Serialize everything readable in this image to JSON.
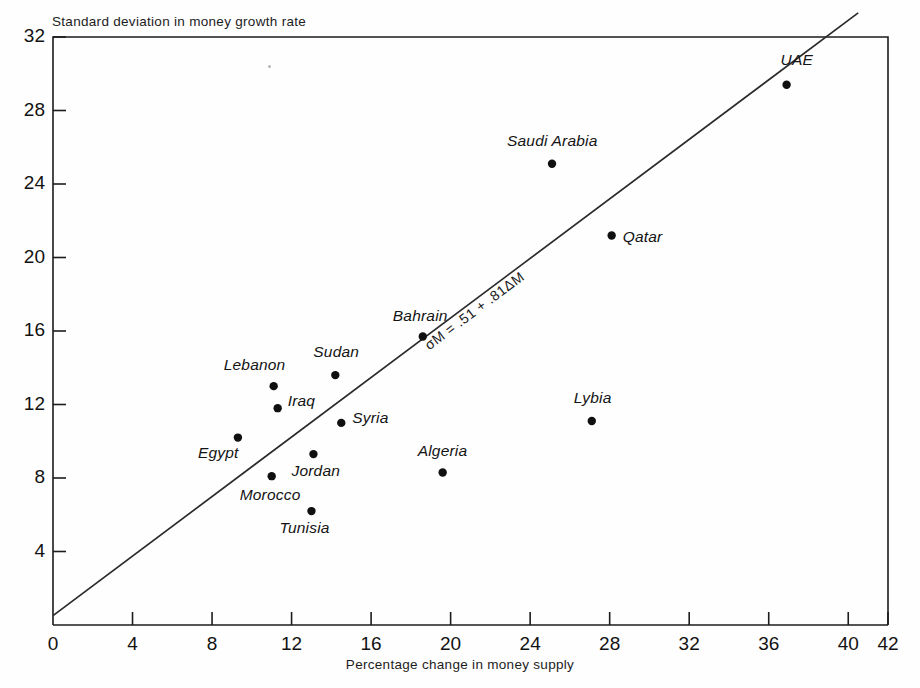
{
  "chart_data": {
    "type": "scatter",
    "title": "",
    "xlabel": "Percentage change in money supply",
    "ylabel": "Standard deviation in money growth rate",
    "xlim": [
      0,
      42
    ],
    "ylim": [
      0,
      32
    ],
    "xticks": [
      0,
      4,
      8,
      12,
      16,
      20,
      24,
      28,
      32,
      36,
      40,
      42
    ],
    "yticks": [
      4,
      8,
      12,
      16,
      20,
      24,
      28,
      32
    ],
    "grid": false,
    "legend": "none",
    "points": [
      {
        "label": "Egypt",
        "x": 9.3,
        "y": 10.2
      },
      {
        "label": "Morocco",
        "x": 11.0,
        "y": 8.1
      },
      {
        "label": "Lebanon",
        "x": 11.1,
        "y": 13.0
      },
      {
        "label": "Iraq",
        "x": 11.3,
        "y": 11.8
      },
      {
        "label": "Tunisia",
        "x": 13.0,
        "y": 6.2
      },
      {
        "label": "Jordan",
        "x": 13.1,
        "y": 9.3
      },
      {
        "label": "Sudan",
        "x": 14.2,
        "y": 13.6
      },
      {
        "label": "Syria",
        "x": 14.5,
        "y": 11.0
      },
      {
        "label": "Bahrain",
        "x": 18.6,
        "y": 15.7
      },
      {
        "label": "Algeria",
        "x": 19.6,
        "y": 8.3
      },
      {
        "label": "Saudi Arabia",
        "x": 25.1,
        "y": 25.1
      },
      {
        "label": "Lybia",
        "x": 27.1,
        "y": 11.1
      },
      {
        "label": "Qatar",
        "x": 28.1,
        "y": 21.2
      },
      {
        "label": "UAE",
        "x": 36.9,
        "y": 29.4
      }
    ],
    "fit_line": {
      "equation": "σM = .51 + .81ΔM",
      "intercept": 0.51,
      "slope": 0.81,
      "x_start": 0,
      "x_end": 40.5
    },
    "marker_color": "#101010",
    "line_color": "#2b2b2b",
    "axis_color": "#1c1c1c"
  },
  "labels": {
    "ylabel_title": "Standard deviation in money growth rate",
    "xlabel_title": "Percentage change in money supply",
    "equation": "σM = .51 + .81ΔM",
    "yticks": [
      "4",
      "8",
      "12",
      "16",
      "20",
      "24",
      "28",
      "32"
    ],
    "xticks": [
      "0",
      "4",
      "8",
      "12",
      "16",
      "20",
      "24",
      "28",
      "32",
      "36",
      "40",
      "42"
    ],
    "points": [
      "Egypt",
      "Morocco",
      "Lebanon",
      "Iraq",
      "Tunisia",
      "Jordan",
      "Sudan",
      "Syria",
      "Bahrain",
      "Algeria",
      "Saudi Arabia",
      "Lybia",
      "Qatar",
      "UAE"
    ]
  }
}
